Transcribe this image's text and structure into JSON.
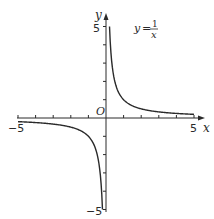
{
  "chart_data": {
    "type": "line",
    "title": "",
    "function_label": {
      "lhs": "y",
      "numerator": "1",
      "denominator": "x"
    },
    "xlabel": "x",
    "ylabel": "y",
    "origin_label": "O",
    "xlim": [
      -5,
      5
    ],
    "ylim": [
      -5,
      5
    ],
    "x_tick_labels": [
      {
        "value": -5,
        "label": "−5"
      },
      {
        "value": 5,
        "label": "5"
      }
    ],
    "y_tick_labels": [
      {
        "value": 5,
        "label": "5"
      },
      {
        "value": -5,
        "label": "−5"
      }
    ],
    "tick_step": 1,
    "grid": false,
    "series": [
      {
        "name": "y = 1/x (x > 0)",
        "points": [
          [
            0.2,
            5
          ],
          [
            0.25,
            4
          ],
          [
            0.5,
            2
          ],
          [
            1,
            1
          ],
          [
            2,
            0.5
          ],
          [
            3,
            0.333
          ],
          [
            4,
            0.25
          ],
          [
            5,
            0.2
          ]
        ]
      },
      {
        "name": "y = 1/x (x < 0)",
        "points": [
          [
            -5,
            -0.2
          ],
          [
            -4,
            -0.25
          ],
          [
            -3,
            -0.333
          ],
          [
            -2,
            -0.5
          ],
          [
            -1,
            -1
          ],
          [
            -0.5,
            -2
          ],
          [
            -0.25,
            -4
          ],
          [
            -0.2,
            -5
          ]
        ]
      }
    ],
    "colors": {
      "axis": "#2a2a2a",
      "curve": "#2a2a2a"
    }
  }
}
